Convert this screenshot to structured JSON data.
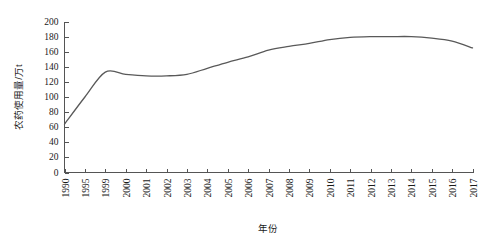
{
  "chart_data": {
    "type": "line",
    "title": "",
    "xlabel": "年份",
    "ylabel": "农药使用量/万t",
    "ylim": [
      0,
      200
    ],
    "yticks": [
      0,
      20,
      40,
      60,
      80,
      100,
      120,
      140,
      160,
      180,
      200
    ],
    "grid": false,
    "legend": "none",
    "line_color": "#595959",
    "categories": [
      "1990",
      "1995",
      "1999",
      "2000",
      "2001",
      "2002",
      "2003",
      "2004",
      "2005",
      "2006",
      "2007",
      "2008",
      "2009",
      "2010",
      "2011",
      "2012",
      "2013",
      "2014",
      "2015",
      "2016",
      "2017"
    ],
    "series": [
      {
        "name": "农药使用量",
        "values": [
          64,
          100,
          133,
          130,
          128,
          128,
          130,
          138,
          146,
          153,
          162,
          167,
          171,
          176,
          179,
          180,
          180,
          180,
          178,
          174,
          165
        ]
      }
    ]
  },
  "figure": {
    "axis_color": "#555555",
    "background": "#ffffff"
  }
}
